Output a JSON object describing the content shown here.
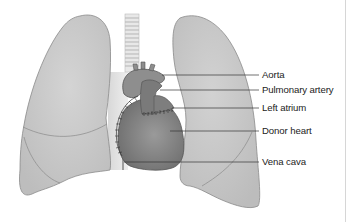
{
  "diagram": {
    "labels": [
      {
        "id": "aorta",
        "text": "Aorta"
      },
      {
        "id": "pulmonary-artery",
        "text": "Pulmonary artery"
      },
      {
        "id": "left-atrium",
        "text": "Left atrium"
      },
      {
        "id": "donor-heart",
        "text": "Donor heart"
      },
      {
        "id": "vena-cava",
        "text": "Vena cava"
      }
    ],
    "colors": {
      "lung_fill": "#c8c8c8",
      "lung_stroke": "#8a8a8a",
      "heart_fill": "#8c8c8c",
      "heart_dark": "#6e6e6e",
      "trachea_fill": "#e6e6e6",
      "leader_line": "#333333"
    }
  }
}
